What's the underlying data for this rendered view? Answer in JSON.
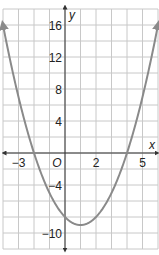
{
  "chart_data": {
    "type": "line",
    "title": "",
    "function": "y = x^2 - 2x - 8",
    "xlabel": "x",
    "ylabel": "y",
    "origin_label": "O",
    "xlim": [
      -4,
      6
    ],
    "ylim": [
      -12,
      18
    ],
    "grid": true,
    "grid_x_step": 1,
    "grid_y_step": 2,
    "x_tick_labels": [
      {
        "value": -3,
        "label": "−3"
      },
      {
        "value": 2,
        "label": "2"
      },
      {
        "value": 5,
        "label": "5"
      }
    ],
    "y_tick_labels": [
      {
        "value": 16,
        "label": "16"
      },
      {
        "value": 12,
        "label": "12"
      },
      {
        "value": 8,
        "label": "8"
      },
      {
        "value": 4,
        "label": "4"
      },
      {
        "value": -4,
        "label": "−4"
      },
      {
        "value": -10,
        "label": "−10"
      }
    ],
    "series": [
      {
        "name": "parabola",
        "color": "#8a8a8a",
        "x": [
          -4,
          -3,
          -2,
          -1,
          0,
          1,
          2,
          3,
          4,
          5,
          6
        ],
        "y": [
          16,
          7,
          0,
          -5,
          -8,
          -9,
          -8,
          -5,
          0,
          7,
          16
        ]
      }
    ],
    "vertex": [
      1,
      -9
    ],
    "x_intercepts": [
      -2,
      4
    ],
    "arrows_at_ends": true
  },
  "colors": {
    "grid": "#c8c8c8",
    "axis": "#333333",
    "curve": "#8a8a8a"
  }
}
